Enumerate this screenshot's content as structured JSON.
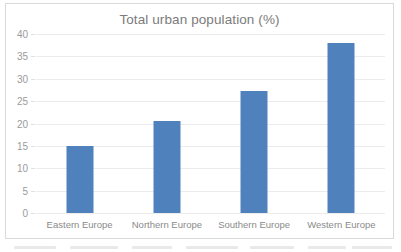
{
  "chart_data": {
    "type": "bar",
    "title": "Total urban population (%)",
    "xlabel": "",
    "ylabel": "",
    "ylim": [
      0,
      40
    ],
    "ytick_step": 5,
    "yticks": [
      "0",
      "5",
      "10",
      "15",
      "20",
      "25",
      "30",
      "35",
      "40"
    ],
    "grid": true,
    "legend": false,
    "categories": [
      "Eastern Europe",
      "Northern Europe",
      "Southern Europe",
      "Western Europe"
    ],
    "values": [
      14.9,
      20.5,
      27.2,
      37.9
    ],
    "bar_color": "#4F81BD",
    "gridline_color": "#ECECEC",
    "title_color": "#7B7B7B",
    "tick_label_color": "#9B9B9B",
    "frame_color": "#D9D9D9",
    "background_color": "#FFFFFF"
  }
}
